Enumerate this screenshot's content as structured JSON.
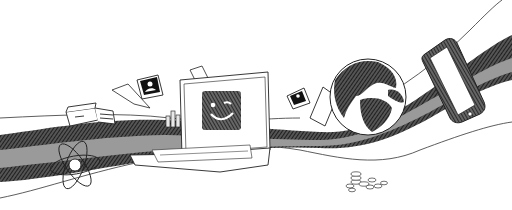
{
  "illustration": {
    "style": "pen-and-ink sketch",
    "colors": {
      "background": "#ffffff",
      "ink": "#1a1a1a",
      "band": "#9a9a9a",
      "hatch": "#2a2a2a"
    },
    "objects": [
      "printer",
      "photo-card",
      "paper-sheet",
      "bar-chart-buildings",
      "laptop",
      "smiley-screen",
      "photo-card",
      "paper-sheet",
      "globe",
      "smartphone",
      "atom",
      "coins",
      "flowing-ribbon"
    ]
  }
}
